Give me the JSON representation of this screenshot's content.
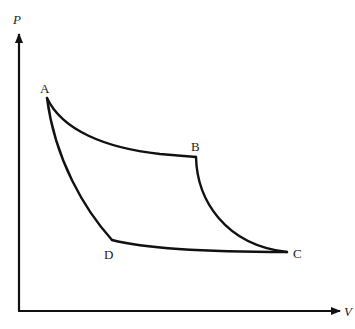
{
  "diagram": {
    "type": "pv-cycle",
    "axes": {
      "y_label": "P",
      "x_label": "V"
    },
    "points": [
      {
        "id": "A",
        "label": "A"
      },
      {
        "id": "B",
        "label": "B"
      },
      {
        "id": "C",
        "label": "C"
      },
      {
        "id": "D",
        "label": "D"
      }
    ],
    "paths": [
      {
        "from": "A",
        "to": "B",
        "shape": "curve"
      },
      {
        "from": "B",
        "to": "C",
        "shape": "curve"
      },
      {
        "from": "C",
        "to": "D",
        "shape": "curve"
      },
      {
        "from": "D",
        "to": "A",
        "shape": "curve"
      }
    ],
    "colors": {
      "stroke": "#111111",
      "background": "#ffffff"
    }
  }
}
